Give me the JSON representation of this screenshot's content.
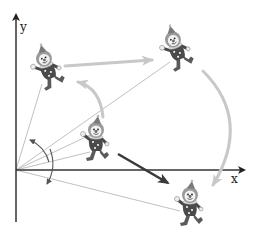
{
  "diagram": {
    "type": "rotation-translation-illustration",
    "axes": {
      "x_label": "x",
      "y_label": "y",
      "origin": [
        16,
        170
      ],
      "color": "#333333"
    },
    "clowns": [
      {
        "id": "center",
        "label": "initial position",
        "cx": 96,
        "cy": 140
      },
      {
        "id": "upper-left",
        "label": "rotated position",
        "cx": 47,
        "cy": 67
      },
      {
        "id": "top-right",
        "label": "translated position",
        "cx": 176,
        "cy": 48
      },
      {
        "id": "bottom-right",
        "label": "final position",
        "cx": 190,
        "cy": 204
      }
    ],
    "arrows": [
      {
        "id": "rotation-arrow",
        "kind": "curved",
        "color": "#c8c8c8",
        "from": "center",
        "to": "upper-left"
      },
      {
        "id": "translation-arrow",
        "kind": "straight",
        "color": "#c8c8c8",
        "from": "upper-left",
        "to": "top-right"
      },
      {
        "id": "rotation-arc-arrow",
        "kind": "curved",
        "color": "#c8c8c8",
        "from": "top-right",
        "to": "bottom-right"
      },
      {
        "id": "direct-arrow",
        "kind": "straight",
        "color": "#333333",
        "from": "center",
        "to": "bottom-right"
      }
    ],
    "colors": {
      "axis": "#333333",
      "guide_line": "#b0b0b0",
      "light_arrow": "#c8c8c8",
      "dark_arrow": "#3a3a3a",
      "angle_arc": "#555555"
    }
  }
}
